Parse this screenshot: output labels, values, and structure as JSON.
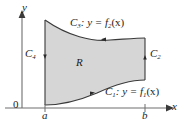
{
  "figure": {
    "type": "region-with-boundary-curves",
    "background_color": "#ffffff",
    "region_fill_color": "#d6d6d6",
    "stroke_color": "#3a3a3a",
    "axes": {
      "x_axis_label": "x",
      "y_axis_label": "y",
      "origin_label": "0",
      "x_ticks": [
        {
          "label": "a",
          "position": "left-boundary"
        },
        {
          "label": "b",
          "position": "right-boundary"
        }
      ]
    },
    "region": {
      "label": "R"
    },
    "boundary_curves": [
      {
        "name": "C1",
        "label_curve": "C",
        "label_sub": "1",
        "label_equation": ": y = f",
        "label_eq_sub": "1",
        "label_eq_tail": "(x)",
        "full_text": "C1: y = f1(x)",
        "description": "lower boundary curve, oriented left to right"
      },
      {
        "name": "C2",
        "label_curve": "C",
        "label_sub": "2",
        "full_text": "C2",
        "description": "right vertical boundary segment, oriented upward"
      },
      {
        "name": "C3",
        "label_curve": "C",
        "label_sub": "3",
        "label_equation": ": y = f",
        "label_eq_sub": "2",
        "label_eq_tail": "(x)",
        "full_text": "C3: y = f2(x)",
        "description": "upper boundary curve, oriented right to left"
      },
      {
        "name": "C4",
        "label_curve": "C",
        "label_sub": "4",
        "full_text": "C4",
        "description": "left vertical boundary segment, oriented downward"
      }
    ]
  }
}
